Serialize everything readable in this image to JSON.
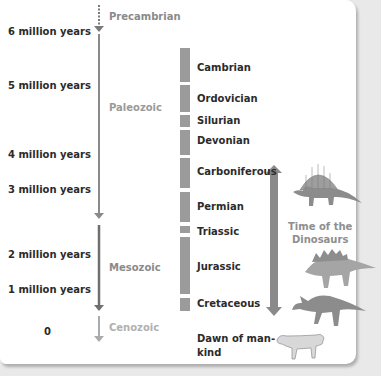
{
  "time_axis": {
    "labels": [
      {
        "text": "6 million years"
      },
      {
        "text": "5 million years"
      },
      {
        "text": "4 million years"
      },
      {
        "text": "3 million years"
      },
      {
        "text": "2 million years"
      },
      {
        "text": "1 million years"
      },
      {
        "text": "0"
      }
    ]
  },
  "eras": [
    {
      "name": "Precambrian",
      "style": "dotted"
    },
    {
      "name": "Paleozoic",
      "style": "solid"
    },
    {
      "name": "Mesozoic",
      "style": "solid-dark"
    },
    {
      "name": "Cenozoic",
      "style": "light"
    }
  ],
  "periods": [
    {
      "name": "Cambrian"
    },
    {
      "name": "Ordovician"
    },
    {
      "name": "Silurian"
    },
    {
      "name": "Devonian"
    },
    {
      "name": "Carboniferous"
    },
    {
      "name": "Permian"
    },
    {
      "name": "Triassic"
    },
    {
      "name": "Jurassic"
    },
    {
      "name": "Cretaceous"
    },
    {
      "name": "Dawn of man-",
      "name_line2": "kind"
    }
  ],
  "dinosaur_span": {
    "label_line1": "Time of the",
    "label_line2": "Dinosaurs"
  },
  "illustrations": [
    {
      "name": "dimetrodon-icon"
    },
    {
      "name": "stegosaurus-icon"
    },
    {
      "name": "parasaurolophus-icon"
    },
    {
      "name": "sabertooth-cat-icon"
    }
  ],
  "colors": {
    "bar": "#9b9b9b",
    "arrow_dark": "#6f6f6f",
    "arrow_light": "#ababab",
    "text_dark": "#2b2b2b",
    "text_gray": "#9a9a9a"
  }
}
